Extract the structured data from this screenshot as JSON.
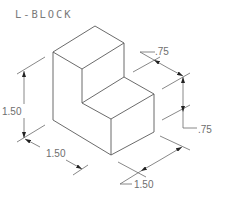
{
  "drawing": {
    "title": "L-BLOCK",
    "view": "isometric",
    "colors": {
      "lines": "#5a5a5a",
      "text": "#6e6e6e",
      "background": "#ffffff"
    }
  },
  "dimensions": {
    "height_overall": "1.50",
    "depth_left": "1.50",
    "width_right": "1.50",
    "step_depth_top": ".75",
    "step_height_right": ".75"
  }
}
